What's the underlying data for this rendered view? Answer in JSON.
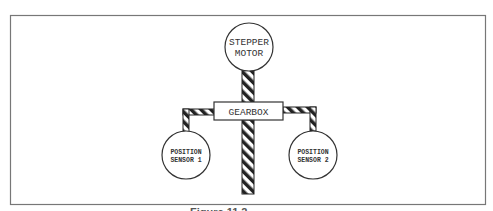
{
  "diagram": {
    "components": {
      "motor": {
        "label_line1": "STEPPER",
        "label_line2": "MOTOR"
      },
      "gearbox": {
        "label": "GEARBOX"
      },
      "sensor1": {
        "label_line1": "POSITION",
        "label_line2": "SENSOR 1"
      },
      "sensor2": {
        "label_line1": "POSITION",
        "label_line2": "SENSOR 2"
      }
    },
    "caption": "Figure 11.2  ..."
  },
  "colors": {
    "stroke": "#333333",
    "frame": "#777777",
    "background": "#ffffff"
  }
}
